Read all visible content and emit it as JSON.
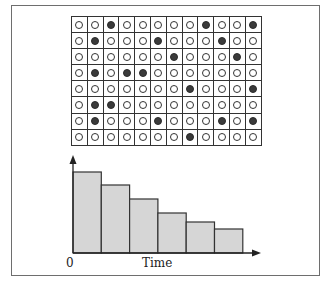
{
  "figure": {
    "grid": {
      "rows": 8,
      "cols": 12,
      "cells": [
        [
          0,
          0,
          1,
          0,
          0,
          0,
          0,
          0,
          1,
          0,
          0,
          1
        ],
        [
          0,
          1,
          0,
          0,
          0,
          1,
          0,
          0,
          0,
          1,
          0,
          0
        ],
        [
          0,
          0,
          0,
          0,
          0,
          0,
          1,
          0,
          0,
          0,
          1,
          0
        ],
        [
          0,
          1,
          0,
          1,
          1,
          0,
          0,
          0,
          0,
          0,
          0,
          0
        ],
        [
          0,
          0,
          0,
          0,
          0,
          0,
          0,
          1,
          0,
          0,
          0,
          1
        ],
        [
          0,
          1,
          1,
          0,
          0,
          0,
          0,
          0,
          0,
          0,
          0,
          0
        ],
        [
          0,
          1,
          0,
          0,
          0,
          1,
          0,
          0,
          0,
          1,
          0,
          1
        ],
        [
          0,
          0,
          0,
          0,
          0,
          0,
          0,
          1,
          0,
          0,
          0,
          0
        ]
      ]
    },
    "colors": {
      "bar_fill": "#d6d6d6",
      "bar_stroke": "#333333",
      "axis": "#222222",
      "filled_dot": "#3a3a3a"
    }
  },
  "chart_data": {
    "type": "bar",
    "title": "",
    "xlabel": "Time",
    "ylabel": "",
    "x_origin_label": "0",
    "categories": [
      "1",
      "2",
      "3",
      "4",
      "5",
      "6"
    ],
    "values": [
      81,
      68,
      54,
      40,
      31,
      24
    ],
    "ylim": [
      0,
      96
    ],
    "grid": false,
    "legend": null
  },
  "labels": {
    "origin": "0",
    "xaxis": "Time"
  }
}
